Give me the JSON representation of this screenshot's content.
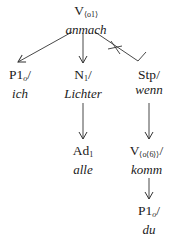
{
  "diagram": {
    "type": "dependency-tree",
    "nodes": [
      {
        "id": "root",
        "cat": "V",
        "sub": "⟨o1⟩",
        "sep": "",
        "word": "anmach"
      },
      {
        "id": "p1",
        "cat": "P1",
        "sub": "o",
        "sep": "/",
        "word": "ich"
      },
      {
        "id": "n1",
        "cat": "N",
        "sub": "1",
        "sep": "/",
        "word": "Lichter"
      },
      {
        "id": "stp",
        "cat": "Stp",
        "sub": "",
        "sep": "/",
        "word": "wenn"
      },
      {
        "id": "ad1",
        "cat": "Ad",
        "sub": "1",
        "sep": "",
        "word": "alle"
      },
      {
        "id": "v2",
        "cat": "V",
        "sub": "⟨o⟨6⟩⟩",
        "sep": "/",
        "word": "komm"
      },
      {
        "id": "p1b",
        "cat": "P1",
        "sub": "o",
        "sep": "/",
        "word": "du"
      }
    ],
    "edges": [
      {
        "from": "root",
        "to": "p1",
        "style": "arrow"
      },
      {
        "from": "root",
        "to": "n1",
        "style": "arrow"
      },
      {
        "from": "root",
        "to": "stp",
        "style": "crossed-hook"
      },
      {
        "from": "n1",
        "to": "ad1",
        "style": "arrow"
      },
      {
        "from": "stp",
        "to": "v2",
        "style": "arrow"
      },
      {
        "from": "v2",
        "to": "p1b",
        "style": "arrow"
      }
    ],
    "colors": {
      "line": "#333333",
      "text": "#1a1a1a",
      "background": "#ffffff"
    }
  }
}
